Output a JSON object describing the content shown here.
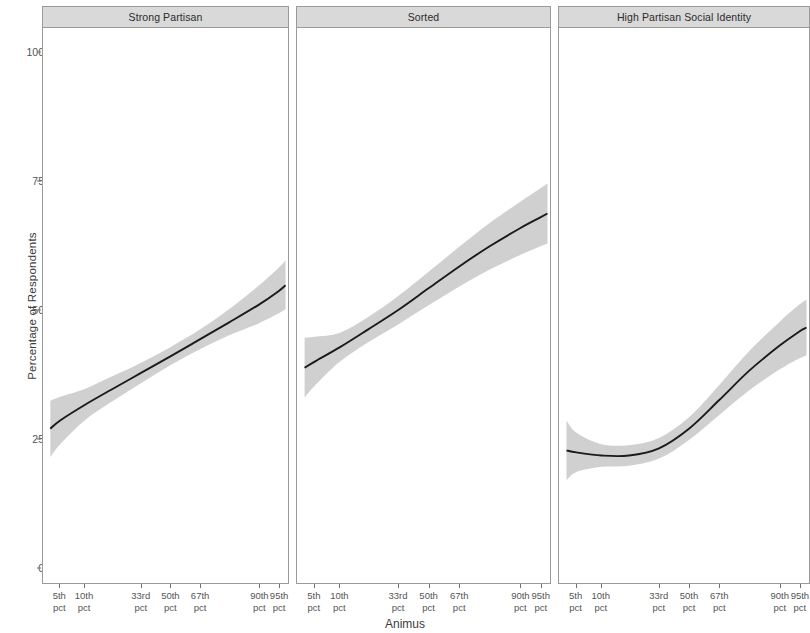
{
  "chart_data": {
    "type": "line",
    "title": "",
    "xlabel": "Animus",
    "ylabel": "Percentage of Respondents",
    "ylim": [
      0,
      107
    ],
    "yticks": [
      0,
      25,
      50,
      75,
      100
    ],
    "ytick_labels": [
      "0",
      "25",
      "50",
      "75",
      "100"
    ],
    "grid": false,
    "legend": "none",
    "x": [
      0,
      1,
      2,
      3,
      4,
      5,
      6
    ],
    "xtick_labels": [
      "5th pct",
      "10th pct",
      "33rd pct",
      "50th pct",
      "67th pct",
      "90th pct",
      "95th pct"
    ],
    "xtick_positions_pct": [
      7.0,
      17.0,
      40.0,
      52.0,
      64.0,
      88.0,
      96.0
    ],
    "band_color": "#d0d0d0",
    "line_color": "#1a1a1a",
    "panels": [
      {
        "label": "Strong Partisan",
        "series": [
          {
            "name": "Predicted percentage",
            "x_pct": [
              3.0,
              7.0,
              17.0,
              28.0,
              40.0,
              52.0,
              64.0,
              76.0,
              88.0,
              96.0,
              99.0
            ],
            "values": [
              27.0,
              28.6,
              31.6,
              34.6,
              37.8,
              41.0,
              44.3,
              47.6,
              51.0,
              53.6,
              54.8
            ],
            "lower": [
              21.5,
              24.0,
              28.6,
              32.2,
              35.8,
              39.3,
              42.4,
              45.1,
              47.4,
              49.3,
              50.2
            ],
            "upper": [
              32.4,
              33.2,
              34.7,
              37.1,
              39.8,
              42.8,
              46.2,
              50.2,
              54.7,
              58.1,
              59.6
            ]
          }
        ]
      },
      {
        "label": "Sorted",
        "series": [
          {
            "name": "Predicted percentage",
            "x_pct": [
              3.0,
              7.0,
              17.0,
              28.0,
              40.0,
              52.0,
              64.0,
              76.0,
              88.0,
              96.0,
              99.0
            ],
            "values": [
              38.8,
              40.0,
              42.8,
              46.2,
              50.0,
              54.2,
              58.4,
              62.3,
              65.8,
              67.9,
              68.7
            ],
            "lower": [
              33.0,
              35.3,
              40.0,
              43.7,
              47.2,
              50.9,
              54.5,
              57.8,
              60.6,
              62.3,
              62.9
            ],
            "upper": [
              44.6,
              44.8,
              45.6,
              48.6,
              52.7,
              57.4,
              62.2,
              66.8,
              70.9,
              73.5,
              74.5
            ]
          }
        ]
      },
      {
        "label": "High Partisan Social Identity",
        "series": [
          {
            "name": "Predicted percentage",
            "x_pct": [
              3.0,
              7.0,
              17.0,
              28.0,
              40.0,
              52.0,
              64.0,
              76.0,
              88.0,
              96.0,
              99.0
            ],
            "values": [
              22.8,
              22.4,
              21.8,
              21.8,
              23.2,
              27.0,
              32.5,
              38.2,
              43.0,
              45.8,
              46.6
            ],
            "lower": [
              17.0,
              18.6,
              19.6,
              19.8,
              21.2,
              24.8,
              29.6,
              34.4,
              38.4,
              40.6,
              41.2
            ],
            "upper": [
              28.6,
              26.2,
              24.0,
              23.8,
              25.2,
              29.2,
              35.4,
              42.0,
              47.6,
              51.0,
              52.0
            ]
          }
        ]
      }
    ]
  },
  "figure": {
    "ylabel": "Percentage of Respondents",
    "xlabel": "Animus"
  }
}
